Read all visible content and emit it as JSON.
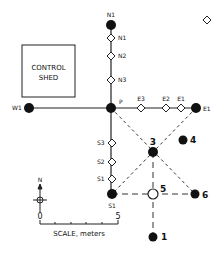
{
  "diagram": {
    "control_shed": {
      "line1": "CONTROL",
      "line2": "SHED"
    },
    "labels": {
      "n1_top": "N1",
      "n1": "N1",
      "n2": "N2",
      "n3": "N3",
      "p": "P",
      "w1": "W1",
      "e3": "E3",
      "e2": "E2",
      "e1_diamond": "E1",
      "e1": "E1",
      "s3": "S3",
      "s2": "S2",
      "s1_diamond": "S1",
      "s1": "S1",
      "node3": "3",
      "node4": "4",
      "node5": "5",
      "node6": "6",
      "node1": "1"
    },
    "legend": {
      "north": "N",
      "scale_zero": "0",
      "scale_five": "5",
      "scale_label": "SCALE, meters"
    }
  }
}
